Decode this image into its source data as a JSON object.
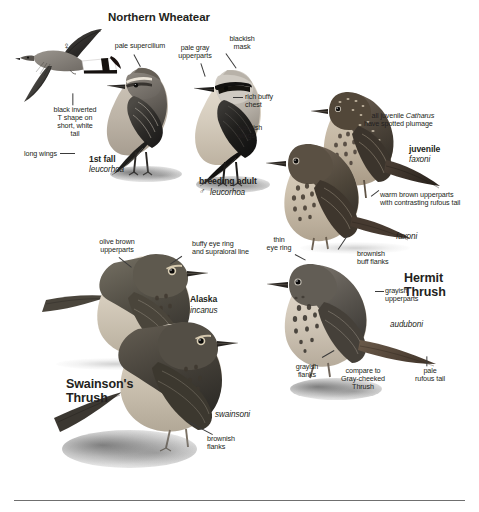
{
  "plate": {
    "title": "Northern Wheatear",
    "species_headings": [
      {
        "name": "Northern Wheatear"
      },
      {
        "name": "Hermit\nThrush"
      },
      {
        "name": "Swainson's\nThrush"
      }
    ]
  },
  "wheatear": {
    "title": "Northern Wheatear",
    "flight": {
      "sex_symbol": "♀",
      "tail_note": "black inverted\nT shape on\nshort, white\ntail",
      "wing_note": "long wings"
    },
    "first_fall": {
      "age_label": "1st fall",
      "subspecies": "leucorhoa",
      "supercilium_note": "pale supercilium"
    },
    "breeding_adult": {
      "age_label": "breeding adult",
      "sex_symbol": "♂",
      "subspecies": "leucorhoa",
      "upperparts_note": "pale gray\nupperparts",
      "mask_note": "blackish\nmask",
      "chest_note": "rich buffy\nchest",
      "wings_note": "blackish\nwings"
    }
  },
  "hermit_thrush": {
    "title": "Hermit\nThrush",
    "juvenile": {
      "age_label": "juvenile",
      "subspecies": "faxoni",
      "plumage_note": "all juvenile Catharus\nhave spotted plumage",
      "plumage_note_plain_a": "all juvenile ",
      "plumage_note_genus": "Catharus",
      "plumage_note_plain_b": "\nhave spotted plumage",
      "upperparts_note": "warm brown upperparts\nwith contrasting rufous tail"
    },
    "faxoni_adult": {
      "subspecies": "faxoni",
      "flanks_note": "brownish\nbuff flanks",
      "eyering_note": "thin\neye ring"
    },
    "auduboni": {
      "subspecies": "auduboni",
      "upperparts_note": "grayish\nupperparts",
      "flanks_note": "grayish\nflanks",
      "compare_note": "compare to\nGray-cheeked\nThrush",
      "tail_note": "pale\nrufous tail"
    }
  },
  "swainsons_thrush": {
    "title": "Swainson's\nThrush",
    "alaska": {
      "region_label": "Alaska",
      "subspecies": "incanus",
      "upperparts_note": "olive brown\nupperparts",
      "eyering_note": "buffy eye ring\nand supraloral line"
    },
    "swainsoni": {
      "subspecies": "swainsoni",
      "flanks_note": "brownish\nflanks"
    }
  },
  "style": {
    "ink": "#231f20",
    "leader": "#3a3a3a",
    "paper": "#ffffff"
  }
}
